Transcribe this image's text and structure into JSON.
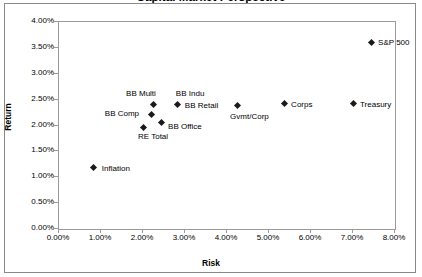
{
  "chart_data": {
    "type": "scatter",
    "title": "Capital Market Perspective",
    "xlabel": "Risk",
    "ylabel": "Return",
    "xlim": [
      0,
      8
    ],
    "ylim": [
      0,
      4
    ],
    "xtick_labels": [
      "0.00%",
      "1.00%",
      "2.00%",
      "3.00%",
      "4.00%",
      "5.00%",
      "6.00%",
      "7.00%",
      "8.00%"
    ],
    "xticks": [
      0,
      1,
      2,
      3,
      4,
      5,
      6,
      7,
      8
    ],
    "ytick_labels": [
      "0.00%",
      "0.50%",
      "1.00%",
      "1.50%",
      "2.00%",
      "2.50%",
      "3.00%",
      "3.50%",
      "4.00%"
    ],
    "yticks": [
      0,
      0.5,
      1,
      1.5,
      2,
      2.5,
      3,
      3.5,
      4
    ],
    "grid": false,
    "legend": "none",
    "marker_color": "#1a1a1a",
    "points": [
      {
        "label": "S&P 500",
        "x": 7.43,
        "y": 3.61,
        "label_dx": 7,
        "label_dy": -4
      },
      {
        "label": "Treasury",
        "x": 7.0,
        "y": 2.42,
        "label_dx": 7,
        "label_dy": -4
      },
      {
        "label": "Corps",
        "x": 5.36,
        "y": 2.42,
        "label_dx": 7,
        "label_dy": -4
      },
      {
        "label": "Gvmt/Corp",
        "x": 4.24,
        "y": 2.38,
        "label_dx": -7,
        "label_dy": 6
      },
      {
        "label": "BB Indu",
        "x": 2.83,
        "y": 2.4,
        "label_dx": -2,
        "label_dy": -16
      },
      {
        "label": "BB Retail",
        "x": 2.83,
        "y": 2.4,
        "label_dx": 7,
        "label_dy": -4
      },
      {
        "label": "BB Multi",
        "x": 2.24,
        "y": 2.4,
        "label_dx": -27,
        "label_dy": -16
      },
      {
        "label": "BB Comp",
        "x": 2.21,
        "y": 2.22,
        "label_dx": -47,
        "label_dy": -5
      },
      {
        "label": "BB Office",
        "x": 2.43,
        "y": 2.05,
        "label_dx": 7,
        "label_dy": -1
      },
      {
        "label": "RE Total",
        "x": 2.0,
        "y": 1.97,
        "label_dx": -5,
        "label_dy": 5
      },
      {
        "label": "Inflation",
        "x": 0.83,
        "y": 1.18,
        "label_dx": 8,
        "label_dy": -4
      }
    ]
  }
}
